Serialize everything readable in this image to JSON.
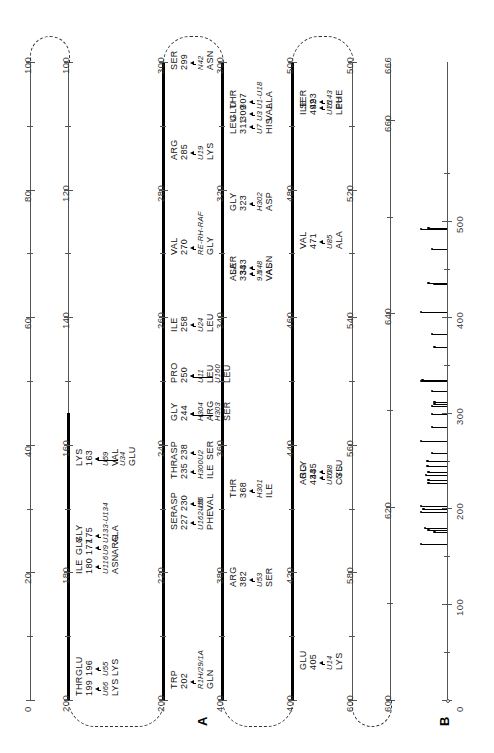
{
  "figure": {
    "panels": [
      {
        "id": "A",
        "letter": "A"
      },
      {
        "id": "B",
        "letter": "B"
      }
    ]
  },
  "panelA": {
    "lines": [
      {
        "index": 0,
        "start": 0,
        "end": 100,
        "weight": "thin",
        "tick_labels": [
          "0",
          "20",
          "40",
          "60",
          "80",
          "100"
        ],
        "tick_values": [
          0,
          20,
          40,
          60,
          80,
          100
        ]
      },
      {
        "index": 1,
        "start": 100,
        "end": 200,
        "weight": "mixed",
        "bold_from": 155,
        "bold_to": 200,
        "tick_labels": [
          "100",
          "120",
          "140",
          "160",
          "180",
          "200"
        ],
        "tick_values": [
          100,
          120,
          140,
          160,
          180,
          200
        ]
      },
      {
        "index": 2,
        "start": 200,
        "end": 300,
        "weight": "bold",
        "tick_labels": [
          "200",
          "220",
          "240",
          "260",
          "280",
          "300"
        ],
        "tick_values": [
          200,
          220,
          240,
          260,
          280,
          300
        ]
      },
      {
        "index": 3,
        "start": 300,
        "end": 400,
        "weight": "bold",
        "tick_labels": [
          "300",
          "320",
          "340",
          "360",
          "380",
          "400"
        ],
        "tick_values": [
          300,
          320,
          340,
          360,
          380,
          400
        ]
      },
      {
        "index": 4,
        "start": 400,
        "end": 500,
        "weight": "bold",
        "tick_labels": [
          "400",
          "420",
          "440",
          "460",
          "480",
          "500"
        ],
        "tick_values": [
          400,
          420,
          440,
          460,
          480,
          500
        ]
      },
      {
        "index": 5,
        "start": 500,
        "end": 600,
        "weight": "thin",
        "tick_labels": [
          "500",
          "520",
          "540",
          "560",
          "580",
          "600"
        ],
        "tick_values": [
          500,
          520,
          540,
          560,
          580,
          600
        ]
      },
      {
        "index": 6,
        "start": 600,
        "end": 666,
        "weight": "thin",
        "tick_labels": [
          "600",
          "620",
          "640",
          "660",
          "666"
        ],
        "tick_values": [
          600,
          620,
          640,
          660,
          666
        ]
      }
    ],
    "annotations": [
      {
        "line": 1,
        "pos": 163,
        "residue": "LYS",
        "number": "163",
        "mutations": [
          "U59 VAL",
          "U34 GLU"
        ],
        "style": "fan"
      },
      {
        "line": 1,
        "pos": 175,
        "residue": "GLY",
        "number": "175",
        "mutations": [
          "U133-U134 ALA"
        ],
        "style": "bracket"
      },
      {
        "line": 1,
        "pos": 177,
        "residue": "GLY",
        "number": "177",
        "mutations": [
          "U9 ARG"
        ],
        "style": "arrow"
      },
      {
        "line": 1,
        "pos": 180,
        "residue": "ILE",
        "number": "180",
        "mutations": [
          "U116 ASN"
        ],
        "style": "bracket"
      },
      {
        "line": 1,
        "pos": 199,
        "residue": "THR",
        "number": "199",
        "mutations": [
          "U66 LYS"
        ],
        "style": "arrow"
      },
      {
        "line": 1,
        "pos": 196,
        "residue": "GLU",
        "number": "196",
        "mutations": [
          "U55 LYS"
        ],
        "style": "arrow"
      },
      {
        "line": 2,
        "pos": 202,
        "residue": "TRP",
        "number": "202",
        "mutations": [
          "R1H/29/1A GLN"
        ],
        "style": "arrow"
      },
      {
        "line": 2,
        "pos": 227,
        "residue": "SER",
        "number": "227",
        "mutations": [
          "U162-U5 PHE"
        ],
        "style": "arrow"
      },
      {
        "line": 2,
        "pos": 230,
        "residue": "ASP",
        "number": "230",
        "mutations": [
          "U56 VAL"
        ],
        "style": "arrow"
      },
      {
        "line": 2,
        "pos": 235,
        "residue": "THR",
        "number": "235",
        "mutations": [
          "H300 ILE"
        ],
        "style": "arrow"
      },
      {
        "line": 2,
        "pos": 238,
        "residue": "ASP",
        "number": "238",
        "mutations": [
          "U2 SER"
        ],
        "style": "arrow"
      },
      {
        "line": 2,
        "pos": 244,
        "residue": "GLY",
        "number": "244",
        "mutations": [
          "H304 ARG",
          "H303 SER"
        ],
        "style": "bracket2"
      },
      {
        "line": 2,
        "pos": 250,
        "residue": "PRO",
        "number": "250",
        "mutations": [
          "U11 LEU",
          "U160 LEU"
        ],
        "style": "bracket2"
      },
      {
        "line": 2,
        "pos": 258,
        "residue": "ILE",
        "number": "258",
        "mutations": [
          "U24 LEU"
        ],
        "style": "arrow"
      },
      {
        "line": 2,
        "pos": 270,
        "residue": "VAL",
        "number": "270",
        "mutations": [
          "RE-RH-RAF GLY"
        ],
        "style": "arrow"
      },
      {
        "line": 2,
        "pos": 285,
        "residue": "ARG",
        "number": "285",
        "mutations": [
          "U19 LYS"
        ],
        "style": "arrow"
      },
      {
        "line": 2,
        "pos": 299,
        "residue": "SER",
        "number": "299",
        "mutations": [
          "N42 ASN"
        ],
        "style": "arrow"
      },
      {
        "line": 3,
        "pos": 307,
        "residue": "THR",
        "number": "307",
        "mutations": [
          "U1-U18 ALA"
        ],
        "style": "bracket"
      },
      {
        "line": 3,
        "pos": 309,
        "residue": "GLU",
        "number": "309",
        "mutations": [
          "U3 VAL"
        ],
        "style": "arrow"
      },
      {
        "line": 3,
        "pos": 311,
        "residue": "LEU",
        "number": "311",
        "mutations": [
          "U7 HIS"
        ],
        "style": "arrow"
      },
      {
        "line": 3,
        "pos": 323,
        "residue": "GLY",
        "number": "323",
        "mutations": [
          "H302 ASP"
        ],
        "style": "arrow"
      },
      {
        "line": 3,
        "pos": 333,
        "residue": "SER",
        "number": "333",
        "mutations": [
          "N48 ASN"
        ],
        "style": "bracket"
      },
      {
        "line": 3,
        "pos": 334,
        "residue": "ALA",
        "number": "334",
        "mutations": [
          "9.1 VAL"
        ],
        "style": "bracket"
      },
      {
        "line": 3,
        "pos": 368,
        "residue": "THR",
        "number": "368",
        "mutations": [
          "H301 ILE"
        ],
        "style": "arrow"
      },
      {
        "line": 3,
        "pos": 382,
        "residue": "ARG",
        "number": "382",
        "mutations": [
          "U53 SER"
        ],
        "style": "arrow"
      },
      {
        "line": 4,
        "pos": 405,
        "residue": "GLU",
        "number": "405",
        "mutations": [
          "U14 LYS"
        ],
        "style": "arrow"
      },
      {
        "line": 4,
        "pos": 434,
        "residue": "ARG",
        "number": "434",
        "mutations": [
          "U70 CYS"
        ],
        "style": "bracket"
      },
      {
        "line": 4,
        "pos": 435,
        "residue": "GLY",
        "number": "435",
        "mutations": [
          "U38 GLU"
        ],
        "style": "bracket"
      },
      {
        "line": 4,
        "pos": 471,
        "residue": "VAL",
        "number": "471",
        "mutations": [
          "U85 ALA"
        ],
        "style": "arrow"
      },
      {
        "line": 4,
        "pos": 492,
        "residue": "ILE",
        "number": "492",
        "mutations": [
          "U75 LEU"
        ],
        "style": "bracket"
      },
      {
        "line": 4,
        "pos": 493,
        "residue": "SER",
        "number": "493",
        "mutations": [
          "U143 PHE"
        ],
        "style": "bracket"
      }
    ]
  },
  "chart_data": {
    "type": "bar",
    "title": "",
    "xlabel": "",
    "ylabel": "",
    "orientation": "horizontal",
    "xlim": [
      0,
      666
    ],
    "tick_labels": [
      "0",
      "100",
      "200",
      "300",
      "400",
      "500"
    ],
    "tick_values": [
      0,
      100,
      200,
      300,
      400,
      500
    ],
    "minor_tick_values": [
      50,
      150,
      250,
      350,
      450,
      550
    ],
    "categories": [
      163,
      175,
      177,
      180,
      196,
      199,
      202,
      227,
      230,
      235,
      238,
      244,
      250,
      258,
      270,
      285,
      299,
      307,
      309,
      311,
      323,
      333,
      334,
      368,
      382,
      405,
      434,
      435,
      471,
      492,
      493
    ],
    "values": [
      0.62,
      0.3,
      0.44,
      0.52,
      0.62,
      0.56,
      0.62,
      0.44,
      0.44,
      0.5,
      0.44,
      0.46,
      0.46,
      0.36,
      0.62,
      0.36,
      0.36,
      0.36,
      0.3,
      0.3,
      0.36,
      0.62,
      0.58,
      0.3,
      0.36,
      0.62,
      0.3,
      0.44,
      0.36,
      0.62,
      0.44
    ],
    "axis_label_top": "666",
    "axis_label_bottom": "0"
  }
}
